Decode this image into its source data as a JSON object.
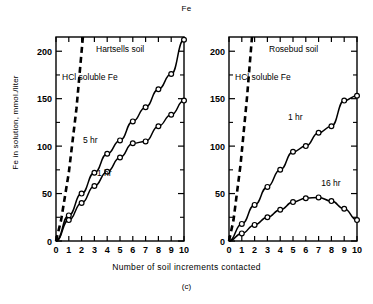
{
  "figure": {
    "title": "Fe",
    "caption": "(c)",
    "xlabel": "Number of soil increments contacted",
    "ylabel": "Fe in solution, mmol./liter"
  },
  "chart_data": [
    {
      "type": "scatter",
      "panel": "left",
      "title": "Hartsells soil",
      "xlabel": "Number of soil increments contacted",
      "ylabel": "Fe in solution, mmol./liter",
      "xlim": [
        0,
        10
      ],
      "ylim": [
        0,
        215
      ],
      "xticks": [
        0,
        1,
        2,
        3,
        4,
        5,
        6,
        7,
        8,
        9,
        10
      ],
      "xticklabels": [
        "0",
        "1",
        "2",
        "3",
        "4",
        "5",
        "6",
        "7",
        "8",
        "9",
        "10"
      ],
      "yticks": [
        0,
        50,
        100,
        150,
        200
      ],
      "yticklabels": [
        "0",
        "50",
        "100",
        "150",
        "200"
      ],
      "yminorticks": [
        25,
        75,
        125,
        175
      ],
      "grid": false,
      "legend": "inline-annotations",
      "series": [
        {
          "name": "HCl soluble Fe",
          "style": "dashed-line",
          "marker": "none",
          "label": "HCl soluble Fe",
          "x": [
            0,
            0.4,
            1.0,
            1.6,
            2.1
          ],
          "y": [
            0,
            22,
            72,
            140,
            215
          ]
        },
        {
          "name": "5 hr",
          "style": "solid-line-with-markers",
          "marker": "open-circle",
          "label": "5 hr",
          "x": [
            0,
            1,
            2,
            3,
            4,
            5,
            6,
            7,
            8,
            9,
            10
          ],
          "y": [
            0,
            27,
            50,
            72,
            92,
            106,
            126,
            141,
            160,
            176,
            212
          ]
        },
        {
          "name": "1 hr",
          "style": "solid-line-with-markers",
          "marker": "open-circle",
          "label": "1 hr",
          "x": [
            0,
            1,
            2,
            3,
            4,
            5,
            6,
            7,
            8,
            9,
            10
          ],
          "y": [
            0,
            22,
            40,
            58,
            73,
            88,
            103,
            105,
            121,
            133,
            148
          ]
        }
      ]
    },
    {
      "type": "scatter",
      "panel": "right",
      "title": "Rosebud soil",
      "xlabel": "Number of soil increments contacted",
      "ylabel": "Fe in solution, mmol./liter",
      "xlim": [
        0,
        10
      ],
      "ylim": [
        0,
        215
      ],
      "xticks": [
        0,
        1,
        2,
        3,
        4,
        5,
        6,
        7,
        8,
        9,
        10
      ],
      "xticklabels": [
        "0",
        "1",
        "2",
        "3",
        "4",
        "5",
        "6",
        "7",
        "8",
        "9",
        "10"
      ],
      "yticks": [
        0,
        50,
        100,
        150,
        200
      ],
      "yticklabels": [
        "0",
        "50",
        "100",
        "150",
        "200"
      ],
      "yminorticks": [
        25,
        75,
        125,
        175
      ],
      "grid": false,
      "legend": "inline-annotations",
      "series": [
        {
          "name": "HCl soluble Fe",
          "style": "dashed-line",
          "marker": "none",
          "label": "HCl soluble Fe",
          "x": [
            0,
            0.35,
            0.9,
            1.4,
            1.8
          ],
          "y": [
            0,
            22,
            80,
            150,
            215
          ]
        },
        {
          "name": "1 hr",
          "style": "solid-line-with-markers",
          "marker": "open-circle",
          "label": "1 hr",
          "x": [
            0,
            1,
            2,
            3,
            4,
            5,
            6,
            7,
            8,
            9,
            10
          ],
          "y": [
            0,
            18,
            38,
            57,
            75,
            94,
            100,
            114,
            121,
            148,
            153
          ]
        },
        {
          "name": "16 hr",
          "style": "solid-line-with-markers",
          "marker": "open-circle",
          "label": "16 hr",
          "x": [
            0,
            1,
            2,
            3,
            4,
            5,
            6,
            7,
            8,
            9,
            10
          ],
          "y": [
            0,
            8,
            17,
            25,
            33,
            41,
            45,
            46,
            42,
            34,
            22
          ]
        }
      ]
    }
  ]
}
